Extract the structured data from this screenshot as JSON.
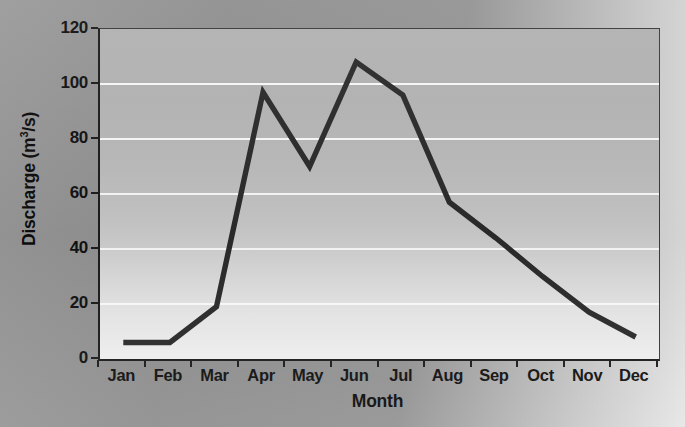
{
  "chart_data": {
    "type": "line",
    "title": "",
    "subtitle": "",
    "xlabel": "Month",
    "ylabel": "Discharge (m3/s)",
    "ylabel_display": "Discharge (m",
    "ylabel_sup": "3",
    "ylabel_tail": "/s)",
    "categories": [
      "Jan",
      "Feb",
      "Mar",
      "Apr",
      "May",
      "Jun",
      "Jul",
      "Aug",
      "Sep",
      "Oct",
      "Nov",
      "Dec"
    ],
    "values": [
      6,
      6,
      19,
      97,
      70,
      108,
      96,
      57,
      44,
      30,
      17,
      8
    ],
    "series": [
      {
        "name": "Discharge",
        "values": [
          6,
          6,
          19,
          97,
          70,
          108,
          96,
          57,
          44,
          30,
          17,
          8
        ],
        "color": "#2b2b2b",
        "line_width": 5
      }
    ],
    "ylim": [
      0,
      120
    ],
    "yticks": [
      0,
      20,
      40,
      60,
      80,
      100,
      120
    ],
    "ytick_labels": [
      "0",
      "20",
      "40",
      "60",
      "80",
      "100",
      "120"
    ],
    "grid": true,
    "grid_axis": "y",
    "grid_color": "#ffffff",
    "legend": false,
    "legend_position": "none",
    "plot_background": "vertical gradient gray to white",
    "figure_background": "#8f8f8f",
    "marker": "none",
    "annotations": []
  },
  "figure": {
    "accent_color": "#2b2b2b",
    "axis_color": "#1c1c1c",
    "text_color": "#111111"
  }
}
